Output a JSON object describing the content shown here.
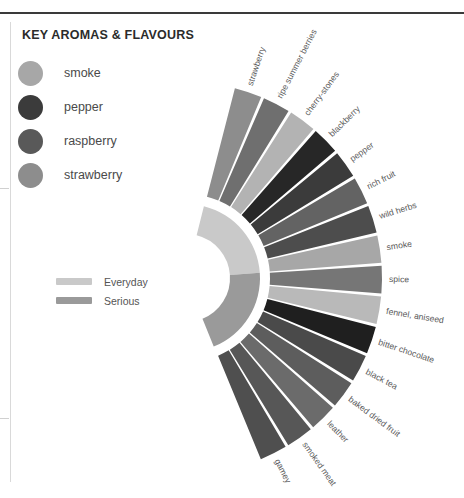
{
  "panel": {
    "title": "KEY AROMAS & FLAVOURS"
  },
  "aroma_legend": {
    "items": [
      {
        "label": "smoke",
        "color": "#a7a7a7"
      },
      {
        "label": "pepper",
        "color": "#3b3b3b"
      },
      {
        "label": "raspberry",
        "color": "#595959"
      },
      {
        "label": "strawberry",
        "color": "#8d8d8d"
      }
    ]
  },
  "tier_legend": {
    "items": [
      {
        "label": "Everyday",
        "color": "#c9c9c9"
      },
      {
        "label": "Serious",
        "color": "#9a9a9a"
      }
    ]
  },
  "chart_data": {
    "type": "pie",
    "title": "KEY AROMAS & FLAVOURS",
    "subtype": "radial-fan",
    "legend_position": "left",
    "grid": false,
    "center": {
      "x": 186,
      "y": 278
    },
    "inner_band": {
      "r_inner": 44,
      "r_outer": 74,
      "segments": [
        {
          "label": "Everyday",
          "color": "#c9c9c9",
          "start_angle": -76,
          "end_angle": -4
        },
        {
          "label": "Serious",
          "color": "#9a9a9a",
          "start_angle": -4,
          "end_angle": 68
        }
      ]
    },
    "spoke_ring": {
      "r_inner": 84,
      "r_outer": 196
    },
    "start_angle": -76,
    "end_angle": 68,
    "categories": [
      "strawberry",
      "ripe summer berries",
      "cherry-stones",
      "blackberry",
      "pepper",
      "rich fruit",
      "wild herbs",
      "smoke",
      "spice",
      "fennel, aniseed",
      "bitter chocolate",
      "black tea",
      "baked dried fruit",
      "leather",
      "smoked meat",
      "gamey"
    ],
    "values": [
      9,
      9,
      9,
      9,
      9,
      9,
      9,
      9,
      9,
      9,
      9,
      9,
      9,
      9,
      9,
      9
    ],
    "colors": [
      "#8d8d8d",
      "#6f6f6f",
      "#b3b3b3",
      "#272727",
      "#3b3b3b",
      "#636363",
      "#4d4d4d",
      "#a7a7a7",
      "#767676",
      "#b9b9b9",
      "#1f1f1f",
      "#4a4a4a",
      "#5d5d5d",
      "#6b6b6b",
      "#575757",
      "#4f4f4f"
    ],
    "xlabel": "",
    "ylabel": ""
  }
}
